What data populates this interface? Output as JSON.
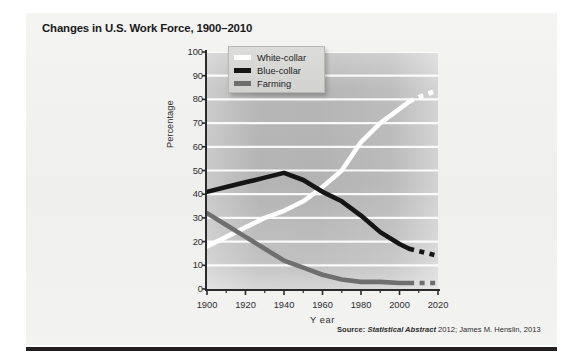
{
  "figure": {
    "title": "Changes in U.S. Work Force, 1900–2010",
    "source_label": "Source:",
    "source_italic": "Statistical Abstract",
    "source_rest": "2012; James M. Henslin, 2013"
  },
  "legend": {
    "position": "top-left-inside",
    "entries": [
      {
        "label": "White-collar",
        "color": "#ffffff"
      },
      {
        "label": "Blue-collar",
        "color": "#151515"
      },
      {
        "label": "Farming",
        "color": "#6f6f6f"
      }
    ]
  },
  "axes": {
    "y_label": "Percentage",
    "x_label": "Y ear",
    "y_ticks": [
      "100",
      "90",
      "80",
      "70",
      "60",
      "50",
      "40",
      "30",
      "20",
      "10",
      "0"
    ],
    "x_ticks": [
      "1900",
      "1920",
      "1940",
      "1960",
      "1980",
      "2000",
      "2020"
    ]
  },
  "chart_data": {
    "type": "line",
    "title": "Changes in U.S. Work Force, 1900–2010",
    "xlabel": "Year",
    "ylabel": "Percentage",
    "xlim": [
      1900,
      2020
    ],
    "ylim": [
      0,
      100
    ],
    "y_ticks": [
      0,
      10,
      20,
      30,
      40,
      50,
      60,
      70,
      80,
      90,
      100
    ],
    "x_ticks": [
      1900,
      1920,
      1940,
      1960,
      1980,
      2000,
      2020
    ],
    "x_minor_tick_step": 10,
    "grid": "horizontal-white-gridlines",
    "plot_background": "gray-gradient",
    "legend_position": "upper-left-inside",
    "note": "Solid segments are historical data; dashed segments after 2005 are projections.",
    "series": [
      {
        "name": "White-collar",
        "color": "#ffffff",
        "x": [
          1900,
          1910,
          1920,
          1930,
          1940,
          1950,
          1960,
          1970,
          1980,
          1990,
          2000,
          2005
        ],
        "values": [
          18,
          22,
          26,
          30,
          33,
          37,
          43,
          50,
          62,
          70,
          76,
          79
        ],
        "projection": {
          "style": "dashed",
          "x": [
            2005,
            2010,
            2015,
            2020
          ],
          "values": [
            79,
            81,
            82.5,
            84
          ]
        }
      },
      {
        "name": "Blue-collar",
        "color": "#151515",
        "x": [
          1900,
          1910,
          1920,
          1930,
          1940,
          1950,
          1960,
          1970,
          1980,
          1990,
          2000,
          2005
        ],
        "values": [
          41,
          43,
          45,
          47,
          49,
          46,
          41,
          37,
          31,
          24,
          19,
          17
        ],
        "projection": {
          "style": "dashed",
          "x": [
            2005,
            2010,
            2015,
            2020
          ],
          "values": [
            17,
            16,
            15,
            14
          ]
        }
      },
      {
        "name": "Farming",
        "color": "#6f6f6f",
        "x": [
          1900,
          1910,
          1920,
          1930,
          1940,
          1950,
          1960,
          1970,
          1980,
          1990,
          2000,
          2005
        ],
        "values": [
          32,
          27,
          22,
          17,
          12,
          9,
          6,
          4,
          3,
          3,
          2.5,
          2.5
        ],
        "projection": {
          "style": "dashed",
          "x": [
            2005,
            2010,
            2015,
            2020
          ],
          "values": [
            2.5,
            2.5,
            2.5,
            2.5
          ]
        }
      }
    ]
  }
}
